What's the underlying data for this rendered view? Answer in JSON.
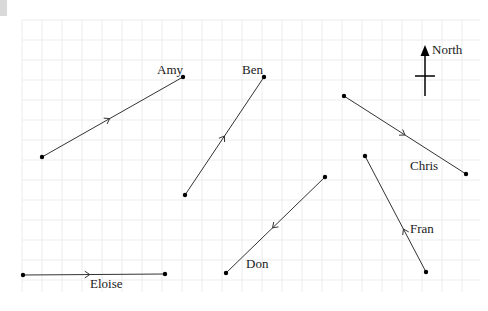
{
  "grid": {
    "x0": 22,
    "y0": 20,
    "x1": 480,
    "y1": 292,
    "step": 20,
    "color": "#ececec"
  },
  "colors": {
    "line": "#333333",
    "text": "#1a1a1a"
  },
  "compass": {
    "label": "North",
    "x": 425,
    "top": 45,
    "bottom": 96,
    "crossbar_y": 76,
    "crossbar_half": 10
  },
  "paths": [
    {
      "name": "Amy",
      "from": [
        42,
        157
      ],
      "to": [
        183,
        77
      ],
      "arrow_t": 0.48,
      "label": "Amy",
      "label_pos": [
        157,
        74
      ]
    },
    {
      "name": "Ben",
      "from": [
        185,
        195
      ],
      "to": [
        264,
        77
      ],
      "arrow_t": 0.5,
      "label": "Ben",
      "label_pos": [
        242,
        74
      ]
    },
    {
      "name": "Chris",
      "from": [
        344,
        96
      ],
      "to": [
        466,
        174
      ],
      "arrow_t": 0.5,
      "label": "Chris",
      "label_pos": [
        410,
        170
      ]
    },
    {
      "name": "Don",
      "from": [
        325,
        177
      ],
      "to": [
        226,
        273
      ],
      "arrow_t": 0.53,
      "label": "Don",
      "label_pos": [
        246,
        268
      ]
    },
    {
      "name": "Eloise",
      "from": [
        23,
        275
      ],
      "to": [
        165,
        274
      ],
      "arrow_t": 0.47,
      "label": "Eloise",
      "label_pos": [
        90,
        288
      ]
    },
    {
      "name": "Fran",
      "from": [
        426,
        272
      ],
      "to": [
        365,
        156
      ],
      "arrow_t": 0.37,
      "label": "Fran",
      "label_pos": [
        410,
        233
      ]
    }
  ]
}
